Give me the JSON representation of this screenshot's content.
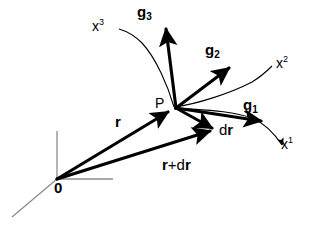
{
  "figure": {
    "background_color": "#ffffff",
    "stroke_color": "#000000",
    "axis_color": "#8c8c8c"
  },
  "labels": {
    "origin": "0",
    "point": "P",
    "position_vector": "r",
    "differential_vector_d": "d",
    "differential_vector_r": "r",
    "sum_vector_r": "r",
    "sum_vector_plus": "+",
    "sum_vector_d": "d",
    "sum_vector_dr": "r",
    "basis_1_base": "g",
    "basis_1_sub": "1",
    "basis_2_base": "g",
    "basis_2_sub": "2",
    "basis_3_base": "g",
    "basis_3_sub": "3",
    "coord_curve_1_base": "x",
    "coord_curve_1_sup": "1",
    "coord_curve_2_base": "x",
    "coord_curve_2_sup": "2",
    "coord_curve_3_base": "x",
    "coord_curve_3_sup": "3"
  },
  "geometry": {
    "origin": {
      "x": 57,
      "y": 179
    },
    "point_p": {
      "x": 176,
      "y": 108
    },
    "dr_tip": {
      "x": 218,
      "y": 131
    },
    "vectors": [
      {
        "name": "r",
        "from": [
          57,
          179
        ],
        "to": [
          172,
          110
        ]
      },
      {
        "name": "r+dr",
        "from": [
          57,
          179
        ],
        "to": [
          214,
          129
        ]
      },
      {
        "name": "dr",
        "from": [
          176,
          108
        ],
        "to": [
          216,
          130
        ]
      },
      {
        "name": "g1",
        "from": [
          176,
          108
        ],
        "to": [
          266,
          122
        ]
      },
      {
        "name": "g2",
        "from": [
          176,
          108
        ],
        "to": [
          232,
          64
        ]
      },
      {
        "name": "g3",
        "from": [
          176,
          108
        ],
        "to": [
          165,
          23
        ]
      }
    ],
    "coordinate_curves": [
      {
        "name": "x1",
        "start": [
          176,
          108
        ],
        "end": [
          283,
          146
        ]
      },
      {
        "name": "x2",
        "start": [
          176,
          108
        ],
        "end": [
          272,
          65
        ]
      },
      {
        "name": "x3",
        "start": [
          173,
          106
        ],
        "end": [
          118,
          29
        ]
      }
    ],
    "reference_axes": [
      {
        "name": "vertical",
        "from": [
          57,
          179
        ],
        "to": [
          57,
          131
        ]
      },
      {
        "name": "horizontal",
        "from": [
          57,
          179
        ],
        "to": [
          113,
          179
        ]
      },
      {
        "name": "diagonal",
        "from": [
          57,
          179
        ],
        "to": [
          12,
          217
        ]
      }
    ]
  },
  "label_positions": {
    "origin": {
      "left": 54,
      "top": 180
    },
    "point": {
      "left": 155,
      "top": 96
    },
    "position_vector": {
      "left": 115,
      "top": 114
    },
    "differential_vector": {
      "left": 219,
      "top": 122
    },
    "sum_vector": {
      "left": 162,
      "top": 157
    },
    "basis_1": {
      "left": 243,
      "top": 97
    },
    "basis_2": {
      "left": 205,
      "top": 42
    },
    "basis_3": {
      "left": 137,
      "top": 4
    },
    "coord_curve_1": {
      "left": 281,
      "top": 137
    },
    "coord_curve_2": {
      "left": 276,
      "top": 56
    },
    "coord_curve_3": {
      "left": 92,
      "top": 19
    }
  }
}
